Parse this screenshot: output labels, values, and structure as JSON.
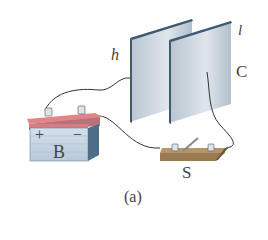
{
  "figure": {
    "caption": "(a)",
    "labels": {
      "battery": "B",
      "switch": "S",
      "capacitor": "C",
      "plate_left": "h",
      "plate_right": "l",
      "plus": "+",
      "minus": "−"
    }
  },
  "colors": {
    "plate_face": "#c9d3dd",
    "plate_edge": "#3d5a72",
    "battery_top": "#e0868a",
    "battery_body": "#c8d6e4",
    "switch_base": "#9a7b52",
    "wire": "#333333"
  }
}
